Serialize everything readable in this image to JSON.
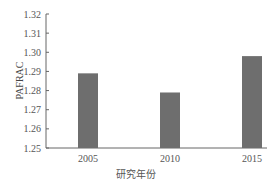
{
  "chart_data": {
    "type": "bar",
    "title": "",
    "xlabel": "研究年份",
    "ylabel": "PAFRAC",
    "categories": [
      "2005",
      "2010",
      "2015"
    ],
    "values": [
      1.289,
      1.279,
      1.298
    ],
    "ylim": [
      1.25,
      1.32
    ],
    "yticks": [
      "1.25",
      "1.26",
      "1.27",
      "1.28",
      "1.29",
      "1.30",
      "1.31",
      "1.32"
    ],
    "grid": false,
    "legend": null,
    "bar_color": "#6e6e6e"
  },
  "labels": {
    "ylabel": "PAFRAC",
    "xlabel": "研究年份"
  }
}
